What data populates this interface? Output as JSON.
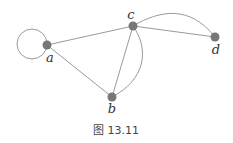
{
  "figure": {
    "caption": "图 13.11"
  },
  "graph": {
    "nodes": [
      {
        "id": "a",
        "label": "a",
        "x": 47,
        "y": 45
      },
      {
        "id": "b",
        "label": "b",
        "x": 112,
        "y": 97
      },
      {
        "id": "c",
        "label": "c",
        "x": 133,
        "y": 26
      },
      {
        "id": "d",
        "label": "d",
        "x": 215,
        "y": 37
      }
    ],
    "edges": [
      {
        "from": "a",
        "to": "a",
        "type": "loop"
      },
      {
        "from": "a",
        "to": "c",
        "type": "straight"
      },
      {
        "from": "a",
        "to": "b",
        "type": "straight"
      },
      {
        "from": "c",
        "to": "b",
        "type": "straight"
      },
      {
        "from": "c",
        "to": "b",
        "type": "curved"
      },
      {
        "from": "c",
        "to": "d",
        "type": "straight"
      },
      {
        "from": "c",
        "to": "d",
        "type": "curved"
      }
    ],
    "colors": {
      "node": "#777777",
      "edge": "#9a9a9a",
      "label": "#333333"
    }
  }
}
